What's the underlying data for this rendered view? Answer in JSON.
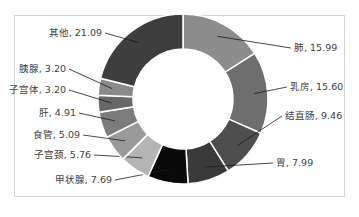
{
  "chart_data": {
    "type": "pie",
    "subtype": "doughnut",
    "title": "",
    "start_angle_deg": 0,
    "direction": "clockwise",
    "slices": [
      {
        "label": "肺",
        "value": 15.99,
        "color": "#8c8c8c"
      },
      {
        "label": "乳房",
        "value": 15.6,
        "color": "#6e6e6e"
      },
      {
        "label": "结直肠",
        "value": 9.46,
        "color": "#4e4e4e"
      },
      {
        "label": "胃",
        "value": 7.99,
        "color": "#3a3a3a"
      },
      {
        "label": "甲状腺",
        "value": 7.69,
        "color": "#0a0a0a"
      },
      {
        "label": "子宫颈",
        "value": 5.76,
        "color": "#b4b4b4"
      },
      {
        "label": "食管",
        "value": 5.09,
        "color": "#9a9a9a"
      },
      {
        "label": "肝",
        "value": 4.91,
        "color": "#7c7c7c"
      },
      {
        "label": "子宫体",
        "value": 3.2,
        "color": "#686868"
      },
      {
        "label": "胰腺",
        "value": 3.2,
        "color": "#8a8a8a"
      },
      {
        "label": "其他",
        "value": 21.09,
        "color": "#3e3e3e"
      }
    ],
    "label_format": "{label}, {value}"
  }
}
